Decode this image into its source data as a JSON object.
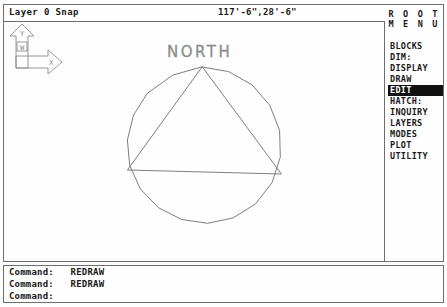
{
  "status": {
    "layer_text": "Layer 0 Snap",
    "coords_text": "117'-6\",28'-6\""
  },
  "drawing": {
    "compass_label": "NORTH",
    "ucs": {
      "y_axis_label": "Y",
      "x_axis_label": "X",
      "world_label": "W"
    },
    "geometry_note": "polygon-with-inscribed-triangle"
  },
  "menu": {
    "title_line1": "R O O T",
    "title_line2": "M E N U",
    "items": [
      {
        "label": "BLOCKS",
        "selected": false
      },
      {
        "label": "DIM:",
        "selected": false
      },
      {
        "label": "DISPLAY",
        "selected": false
      },
      {
        "label": "DRAW",
        "selected": false
      },
      {
        "label": "EDIT",
        "selected": true
      },
      {
        "label": "HATCH:",
        "selected": false
      },
      {
        "label": "INQUIRY",
        "selected": false
      },
      {
        "label": "LAYERS",
        "selected": false
      },
      {
        "label": "MODES",
        "selected": false
      },
      {
        "label": "PLOT",
        "selected": false
      },
      {
        "label": "UTILITY",
        "selected": false
      }
    ]
  },
  "command_window": {
    "lines": [
      {
        "prompt": "Command:",
        "arg": "REDRAW"
      },
      {
        "prompt": "Command:",
        "arg": "REDRAW"
      },
      {
        "prompt": "Command:",
        "arg": ""
      }
    ]
  },
  "colors": {
    "border": "#6e6e6e",
    "geometry": "#6f6f6f",
    "text": "#1a1a1a",
    "highlight_bg": "#111111",
    "highlight_fg": "#ffffff",
    "background": "#fefefe"
  }
}
